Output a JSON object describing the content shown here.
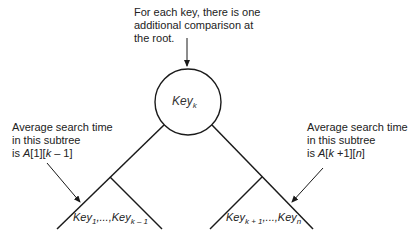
{
  "top_note": {
    "lines": [
      "For each key, there is one",
      "additional comparison at",
      "the root."
    ]
  },
  "root_node": {
    "label": "Key",
    "subscript": "k"
  },
  "left_annotation": {
    "line1": "Average search time",
    "line2": "in this subtree",
    "line3_prefix": "is ",
    "line3_A": "A",
    "line3_rest1": "[1][",
    "line3_k": "k",
    "line3_rest2": " – 1]"
  },
  "right_annotation": {
    "line1": "Average search time",
    "line2": "in this subtree",
    "line3_prefix": "is ",
    "line3_A": "A",
    "line3_rest1": "[",
    "line3_k": "k",
    "line3_rest2": " +1][",
    "line3_n": "n",
    "line3_rest3": "]"
  },
  "left_subtree": {
    "key_a": "Key",
    "sub_a": "1",
    "sep": ",...,",
    "key_b": "Key",
    "sub_b": "k – 1"
  },
  "right_subtree": {
    "key_a": "Key",
    "sub_a": "k + 1",
    "sep": ",...,",
    "key_b": "Key",
    "sub_b": "n"
  },
  "colors": {
    "line": "#1a1a1a",
    "text": "#222222",
    "background": "#ffffff"
  }
}
